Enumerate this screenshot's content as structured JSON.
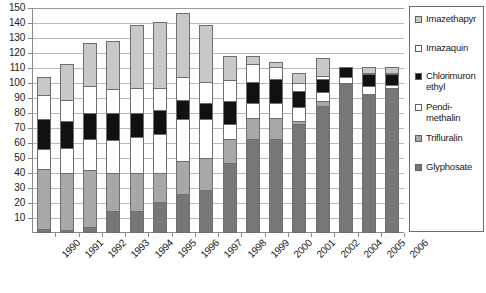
{
  "chart_data": {
    "type": "bar",
    "subtype": "stacked-column",
    "title": "",
    "xlabel": "",
    "ylabel": "",
    "ylim": [
      0,
      150
    ],
    "ytick_step": 10,
    "yticks": [
      10,
      20,
      30,
      40,
      50,
      60,
      70,
      80,
      90,
      100,
      110,
      120,
      130,
      140,
      150
    ],
    "grid": true,
    "legend_position": "right",
    "categories": [
      "1990",
      "1991",
      "1992",
      "1993",
      "1994",
      "1995",
      "1996",
      "1997",
      "1998",
      "1999",
      "2000",
      "2001",
      "2002",
      "2004",
      "2005",
      "2006"
    ],
    "series": [
      {
        "name": "Glyphosate",
        "color": "#777777",
        "values": [
          3,
          2,
          4,
          15,
          15,
          21,
          26,
          29,
          47,
          63,
          63,
          73,
          85,
          100,
          93,
          97
        ]
      },
      {
        "name": "Trifluralin",
        "color": "#a8a8a8",
        "values": [
          40,
          38,
          38,
          25,
          25,
          19,
          22,
          21,
          16,
          14,
          14,
          2,
          3,
          0,
          0,
          0
        ]
      },
      {
        "name": "Pendimethalin",
        "color": "#ffffff",
        "values": [
          13,
          17,
          21,
          22,
          24,
          26,
          28,
          26,
          10,
          10,
          10,
          9,
          6,
          4,
          5,
          2
        ]
      },
      {
        "name": "Chlorimuron ethyl",
        "color": "#111111",
        "values": [
          20,
          18,
          17,
          18,
          16,
          16,
          13,
          11,
          15,
          14,
          16,
          11,
          9,
          7,
          8,
          7
        ]
      },
      {
        "name": "Imazaquin",
        "color": "#ffffff",
        "values": [
          16,
          14,
          18,
          16,
          17,
          15,
          15,
          14,
          14,
          12,
          8,
          5,
          2,
          0,
          1,
          1
        ]
      },
      {
        "name": "Imazethapyr",
        "color": "#c8c8c8",
        "values": [
          12,
          24,
          29,
          32,
          42,
          44,
          43,
          38,
          16,
          5,
          3,
          7,
          12,
          0,
          4,
          4
        ]
      }
    ],
    "totals": [
      104,
      113,
      127,
      128,
      139,
      141,
      147,
      139,
      118,
      118,
      114,
      107,
      117,
      111,
      111,
      111
    ],
    "legend_entries": [
      {
        "label": "Imazethapyr",
        "swatch": "#c8c8c8"
      },
      {
        "label": "Imazaquin",
        "swatch": "#ffffff"
      },
      {
        "label": "Chlorimuron\nethyl",
        "swatch": "#111111"
      },
      {
        "label": "Pendi-\nmethalin",
        "swatch": "#ffffff"
      },
      {
        "label": "Trifluralin",
        "swatch": "#a8a8a8"
      },
      {
        "label": "Glyphosate",
        "swatch": "#777777"
      }
    ]
  },
  "axis": {
    "y_labels": [
      "150",
      "140",
      "130",
      "120",
      "110",
      "100",
      "90",
      "80",
      "70",
      "60",
      "50",
      "40",
      "30",
      "20",
      "10"
    ],
    "x_labels": [
      "1990",
      "1991",
      "1992",
      "1993",
      "1994",
      "1995",
      "1996",
      "1997",
      "1998",
      "1999",
      "2000",
      "2001",
      "2002",
      "2004",
      "2005",
      "2006"
    ]
  },
  "colors": {
    "axis": "#8a8a8a",
    "grid": "#b9b9b9",
    "bar_border": "#6e6e6e",
    "text": "#1a1a1a",
    "background": "#ffffff"
  }
}
